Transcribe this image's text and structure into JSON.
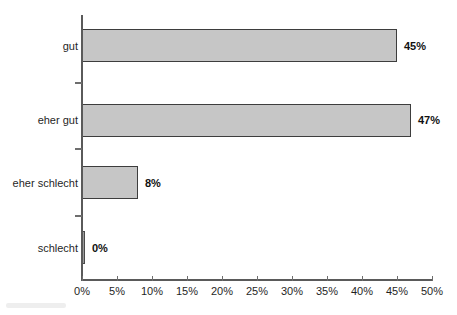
{
  "chart_data": {
    "type": "bar",
    "orientation": "horizontal",
    "title": "",
    "subtitle": "",
    "xlabel": "",
    "ylabel": "",
    "categories": [
      "gut",
      "eher gut",
      "eher schlecht",
      "schlecht"
    ],
    "values": [
      45,
      47,
      8,
      0
    ],
    "value_labels": [
      "45%",
      "47%",
      "8%",
      "0%"
    ],
    "xlim": [
      0,
      50
    ],
    "x_ticks": [
      0,
      5,
      10,
      15,
      20,
      25,
      30,
      35,
      40,
      45,
      50
    ],
    "x_tick_labels": [
      "0%",
      "5%",
      "10%",
      "15%",
      "20%",
      "25%",
      "30%",
      "35%",
      "40%",
      "45%",
      "50%"
    ],
    "grid": false,
    "legend": false,
    "legend_position": "none",
    "series": [
      {
        "name": "Anteil",
        "values": [
          45,
          47,
          8,
          0
        ]
      }
    ],
    "colors": {
      "bar_fill": "#c6c6c6",
      "bar_border": "#3d3d3d",
      "axis": "#5a5a5a",
      "text": "#1f1f1f",
      "background": "#ffffff"
    }
  },
  "bars": [
    {
      "category": "gut",
      "value": 45,
      "label": "45%"
    },
    {
      "category": "eher gut",
      "value": 47,
      "label": "47%"
    },
    {
      "category": "eher schlecht",
      "value": 8,
      "label": "8%"
    },
    {
      "category": "schlecht",
      "value": 0,
      "label": "0%"
    }
  ],
  "axis": {
    "x_tick_labels": [
      "0%",
      "5%",
      "10%",
      "15%",
      "20%",
      "25%",
      "30%",
      "35%",
      "40%",
      "45%",
      "50%"
    ]
  }
}
